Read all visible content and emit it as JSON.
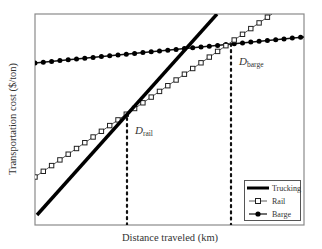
{
  "chart_data": {
    "type": "line",
    "title": "",
    "xlabel": "Distance traveled (km)",
    "ylabel": "Transportation cost ($/ton)",
    "grid": false,
    "axis_ticks": "none (conceptual chart, no numeric tick labels)",
    "legend_position": "lower right",
    "frame_px": {
      "x0": 35,
      "y0": 14,
      "x1": 304,
      "y1": 225
    },
    "series": [
      {
        "name": "Trucking",
        "style": "thick solid line",
        "marker": "none",
        "points_px": [
          [
            37,
            215
          ],
          [
            217,
            14
          ]
        ],
        "relative": {
          "intercept": "lowest",
          "slope": "steepest"
        }
      },
      {
        "name": "Rail",
        "style": "thin line",
        "marker": "open square",
        "points_px": [
          [
            35,
            177
          ],
          [
            272,
            14
          ]
        ],
        "relative": {
          "intercept": "middle",
          "slope": "middle"
        }
      },
      {
        "name": "Barge",
        "style": "thin line",
        "marker": "filled circle",
        "points_px": [
          [
            35,
            63
          ],
          [
            304,
            37
          ]
        ],
        "relative": {
          "intercept": "highest",
          "slope": "shallowest"
        }
      }
    ],
    "annotations": [
      {
        "text": "D",
        "subscript": "rail",
        "meaning": "break-even distance trucking vs rail",
        "x_px": 127,
        "y_top_px": 117,
        "style": "dotted vertical line"
      },
      {
        "text": "D",
        "subscript": "barge",
        "meaning": "break-even distance rail vs barge",
        "x_px": 231,
        "y_top_px": 43,
        "style": "dotted vertical line"
      }
    ]
  },
  "labels": {
    "xlabel": "Distance traveled (km)",
    "ylabel": "Transportation cost ($/ton)",
    "d_rail_main": "D",
    "d_rail_sub": "rail",
    "d_barge_main": "D",
    "d_barge_sub": "barge"
  },
  "legend": {
    "items": [
      {
        "label": "Trucking"
      },
      {
        "label": "Rail"
      },
      {
        "label": "Barge"
      }
    ]
  }
}
